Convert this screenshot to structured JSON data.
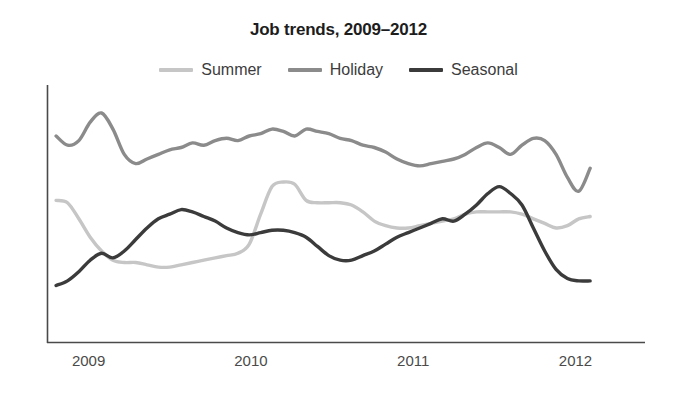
{
  "chart_data": {
    "type": "line",
    "title": "Job trends, 2009–2012",
    "xlabel": "",
    "ylabel": "",
    "grid": false,
    "legend_position": "top-center",
    "xlim": [
      2008.75,
      2012.2
    ],
    "ylim": [
      0,
      100
    ],
    "xticks": [
      "2009",
      "2010",
      "2011",
      "2012"
    ],
    "xtick_values": [
      2009,
      2010,
      2011,
      2012
    ],
    "colors": {
      "summer": "#c6c6c6",
      "holiday": "#8b8b8b",
      "seasonal": "#3b3b3b",
      "axis": "#4a4a4a",
      "title": "#1d1d1d",
      "label": "#4a4a4a",
      "background": "#ffffff"
    },
    "x": [
      2008.8,
      2008.87,
      2008.94,
      2009.01,
      2009.08,
      2009.15,
      2009.22,
      2009.29,
      2009.36,
      2009.43,
      2009.5,
      2009.57,
      2009.64,
      2009.71,
      2009.78,
      2009.85,
      2009.92,
      2009.99,
      2010.06,
      2010.13,
      2010.2,
      2010.27,
      2010.34,
      2010.41,
      2010.48,
      2010.55,
      2010.62,
      2010.69,
      2010.76,
      2010.83,
      2010.9,
      2010.97,
      2011.04,
      2011.11,
      2011.18,
      2011.25,
      2011.32,
      2011.39,
      2011.46,
      2011.53,
      2011.6,
      2011.67,
      2011.74,
      2011.81,
      2011.88,
      2011.95,
      2012.02,
      2012.09
    ],
    "series": [
      {
        "name": "Summer",
        "color": "#c6c6c6",
        "values": [
          52,
          51,
          44,
          36,
          30,
          26,
          25,
          25,
          24,
          23,
          23,
          24,
          25,
          26,
          27,
          28,
          29,
          33,
          46,
          58,
          60,
          59,
          52,
          51,
          51,
          51,
          50,
          47,
          43,
          41,
          40,
          40,
          41,
          42,
          43,
          44,
          46,
          47,
          47,
          47,
          47,
          46,
          44,
          42,
          40,
          41,
          44,
          45
        ]
      },
      {
        "name": "Holiday",
        "color": "#8b8b8b",
        "values": [
          80,
          76,
          78,
          86,
          90,
          83,
          72,
          68,
          70,
          72,
          74,
          75,
          77,
          76,
          78,
          79,
          78,
          80,
          81,
          83,
          82,
          80,
          83,
          82,
          81,
          79,
          78,
          76,
          75,
          73,
          70,
          68,
          67,
          68,
          69,
          70,
          72,
          75,
          77,
          75,
          72,
          76,
          79,
          78,
          72,
          62,
          56,
          66
        ]
      },
      {
        "name": "Seasonal",
        "color": "#3b3b3b",
        "values": [
          15,
          17,
          21,
          26,
          29,
          27,
          30,
          35,
          40,
          44,
          46,
          48,
          47,
          45,
          43,
          40,
          38,
          37,
          38,
          39,
          39,
          38,
          36,
          32,
          28,
          26,
          26,
          28,
          30,
          33,
          36,
          38,
          40,
          42,
          44,
          43,
          46,
          50,
          55,
          58,
          55,
          50,
          40,
          30,
          22,
          18,
          17,
          17
        ]
      }
    ]
  },
  "legend": {
    "items": [
      {
        "label": "Summer",
        "color": "#c6c6c6"
      },
      {
        "label": "Holiday",
        "color": "#8b8b8b"
      },
      {
        "label": "Seasonal",
        "color": "#3b3b3b"
      }
    ]
  }
}
